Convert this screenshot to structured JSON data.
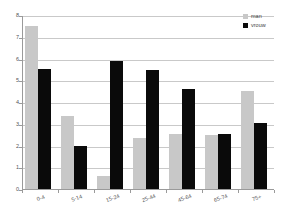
{
  "chart_data": {
    "type": "bar",
    "title": "",
    "xlabel": "",
    "ylabel": "",
    "ylim": [
      0,
      8
    ],
    "ytick_step": 1,
    "grid": true,
    "legend_position": "top-right",
    "categories": [
      "0-4",
      "5-14",
      "15-24",
      "25-44",
      "45-64",
      "65-74",
      "75+"
    ],
    "yticks": [
      "0",
      "1",
      "2",
      "3",
      "4",
      "5",
      "6",
      "7",
      "8"
    ],
    "series": [
      {
        "name": "man",
        "color": "#c8c8c8",
        "values": [
          7.5,
          3.35,
          0.6,
          2.35,
          2.55,
          2.5,
          4.5
        ]
      },
      {
        "name": "vrouw",
        "color": "#0a0a0a",
        "values": [
          5.5,
          2.0,
          5.9,
          5.45,
          4.6,
          2.55,
          3.05
        ]
      }
    ]
  }
}
